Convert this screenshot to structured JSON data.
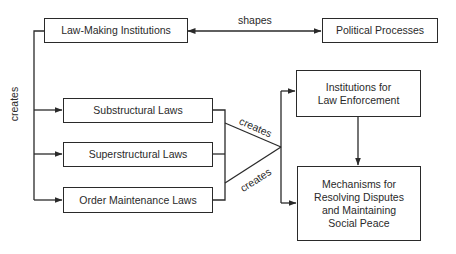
{
  "diagram": {
    "nodes": {
      "law_making": "Law-Making Institutions",
      "political": "Political Processes",
      "substructural": "Substructural Laws",
      "superstructural": "Superstructural Laws",
      "order_maintenance": "Order Maintenance Laws",
      "institutions_line1": "Institutions for",
      "institutions_line2": "Law Enforcement",
      "mechanisms_line1": "Mechanisms for",
      "mechanisms_line2": "Resolving Disputes",
      "mechanisms_line3": "and Maintaining",
      "mechanisms_line4": "Social Peace"
    },
    "edges": {
      "shapes": "shapes",
      "creates_left": "creates",
      "creates_upper": "creates",
      "creates_lower": "creates"
    },
    "colors": {
      "stroke": "#2a2a2a",
      "background": "#ffffff"
    }
  }
}
